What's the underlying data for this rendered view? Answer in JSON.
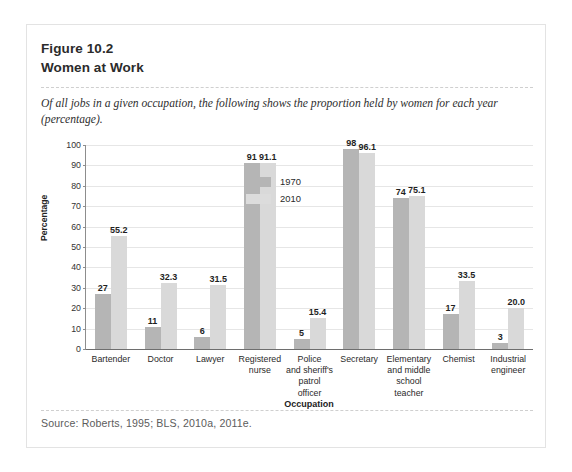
{
  "figure": {
    "number": "Figure 10.2",
    "title": "Women at Work",
    "caption": "Of all jobs in a given occupation, the following shows the proportion held by women for each year (percentage).",
    "source": "Source:  Roberts, 1995; BLS, 2010a, 2011e."
  },
  "colors": {
    "series_1970": "#b5b5b5",
    "series_2010": "#d9d9d9",
    "axis": "#6e6e6e",
    "grid": "#e6e6e6",
    "card_border": "#e3e3e3"
  },
  "chart_data": {
    "type": "bar",
    "title": "Women at Work",
    "xlabel": "Occupation",
    "ylabel": "Percentage",
    "ylim": [
      0,
      100
    ],
    "yticks": [
      0,
      10,
      20,
      30,
      40,
      50,
      60,
      70,
      80,
      90,
      100
    ],
    "grid": true,
    "legend_position": "inside-top-left",
    "categories": [
      "Bartender",
      "Doctor",
      "Lawyer",
      "Registered nurse",
      "Police and sheriff's patrol officer",
      "Secretary",
      "Elementary and middle school teacher",
      "Chemist",
      "Industrial engineer"
    ],
    "category_lines": [
      [
        "Bartender"
      ],
      [
        "Doctor"
      ],
      [
        "Lawyer"
      ],
      [
        "Registered",
        "nurse"
      ],
      [
        "Police",
        "and sheriff's",
        "patrol",
        "officer"
      ],
      [
        "Secretary"
      ],
      [
        "Elementary",
        "and middle",
        "school",
        "teacher"
      ],
      [
        "Chemist"
      ],
      [
        "Industrial",
        "engineer"
      ]
    ],
    "series": [
      {
        "name": "1970",
        "values": [
          27,
          11,
          6,
          91,
          5,
          98,
          74,
          17,
          3
        ],
        "labels": [
          "27",
          "11",
          "6",
          "91",
          "5",
          "98",
          "74",
          "17",
          "3"
        ]
      },
      {
        "name": "2010",
        "values": [
          55.2,
          32.3,
          31.5,
          91.1,
          15.4,
          96.1,
          75.1,
          33.5,
          20.0
        ],
        "labels": [
          "55.2",
          "32.3",
          "31.5",
          "91.1",
          "15.4",
          "96.1",
          "75.1",
          "33.5",
          "20.0"
        ]
      }
    ]
  }
}
